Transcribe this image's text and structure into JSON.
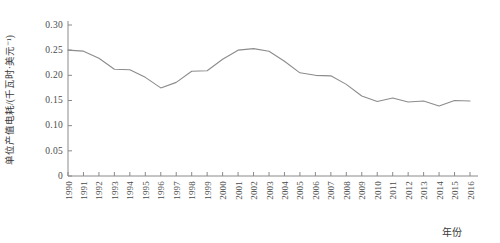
{
  "chart_data": {
    "type": "line",
    "title": "",
    "xlabel": "年份",
    "ylabel": "单位产值电耗/(千瓦时·美元⁻¹)",
    "xlim": [
      1990,
      2016
    ],
    "ylim": [
      0,
      0.3
    ],
    "grid": false,
    "legend": null,
    "line_color": "#8c8c8c",
    "axis_color": "#8a8a8a",
    "yticks": [
      "0",
      "0.05",
      "0.10",
      "0.15",
      "0.20",
      "0.25",
      "0.30"
    ],
    "ytick_values": [
      0,
      0.05,
      0.1,
      0.15,
      0.2,
      0.25,
      0.3
    ],
    "categories": [
      "1990",
      "1991",
      "1992",
      "1993",
      "1994",
      "1995",
      "1996",
      "1997",
      "1998",
      "1999",
      "2000",
      "2001",
      "2002",
      "2003",
      "2004",
      "2005",
      "2006",
      "2007",
      "2008",
      "2009",
      "2010",
      "2011",
      "2012",
      "2013",
      "2014",
      "2015",
      "2016"
    ],
    "values": [
      0.25,
      0.248,
      0.234,
      0.212,
      0.211,
      0.196,
      0.175,
      0.186,
      0.208,
      0.209,
      0.232,
      0.25,
      0.253,
      0.248,
      0.228,
      0.205,
      0.2,
      0.199,
      0.182,
      0.159,
      0.148,
      0.155,
      0.147,
      0.149,
      0.139,
      0.15,
      0.149
    ],
    "series": [
      {
        "name": "单位产值电耗",
        "values": [
          0.25,
          0.248,
          0.234,
          0.212,
          0.211,
          0.196,
          0.175,
          0.186,
          0.208,
          0.209,
          0.232,
          0.25,
          0.253,
          0.248,
          0.228,
          0.205,
          0.2,
          0.199,
          0.182,
          0.159,
          0.148,
          0.155,
          0.147,
          0.149,
          0.139,
          0.15,
          0.149
        ]
      }
    ]
  }
}
